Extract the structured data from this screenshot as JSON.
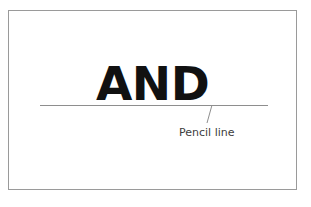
{
  "figure": {
    "title": "AND",
    "kind": "annotated-lettering-diagram",
    "background_color": "#ffffff"
  },
  "card": {
    "border_color": "#9a9a9a",
    "fill_color": "#ffffff"
  },
  "lettering": {
    "text": "AND",
    "color": "#111111"
  },
  "pencil_line": {
    "color": "#8e8e8e",
    "x_start": 40,
    "x_end": 268,
    "y": 105
  },
  "leader": {
    "color": "#8e8e8e",
    "x_top": 212,
    "y_top": 105,
    "x_bottom": 207,
    "y_bottom": 123
  },
  "annotation": {
    "label": "Pencil line",
    "color": "#3d3d3d"
  }
}
